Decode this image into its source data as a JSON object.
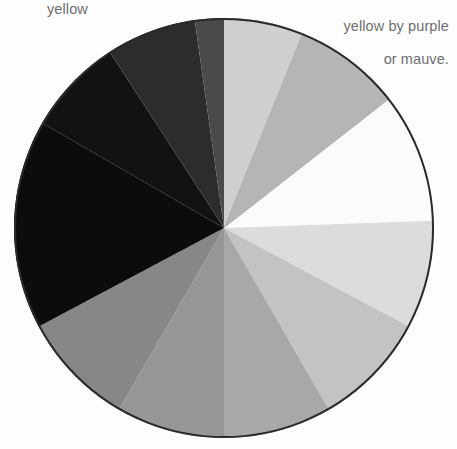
{
  "page": {
    "background_color": "#fdfdfd",
    "width": 457,
    "height": 449
  },
  "captions": {
    "left": {
      "text": "yellow",
      "color": "#6e6e6e",
      "position": "top-left"
    },
    "right": {
      "line1": "yellow by purple",
      "line2": "or mauve.",
      "color": "#6e6e6e",
      "position": "top-right"
    }
  },
  "wheel": {
    "center_x": 224,
    "center_y": 228,
    "radius": 210,
    "outline_color": "#2a2a2a",
    "outline_width": 2,
    "sector_count": 12,
    "description": "Desaturated color wheel rendered in grayscale values"
  },
  "chart_data": {
    "type": "pie",
    "xlabel": "",
    "ylabel": "",
    "legend_position": "none",
    "grid": false,
    "center": [
      224,
      228
    ],
    "radius": 210,
    "note": "Angles measured in degrees clockwise from 12 o'clock (screen up). Each slice is an equal-ish wedge of a desaturated color wheel; value is the gray level of the slice.",
    "categories": [
      "yellow",
      "yellow-orange",
      "orange",
      "red-orange",
      "red",
      "red-violet",
      "violet",
      "blue-violet",
      "blue",
      "blue-green",
      "green",
      "yellow-green"
    ],
    "values": [
      100,
      90,
      78,
      62,
      52,
      46,
      42,
      38,
      30,
      24,
      14,
      5
    ],
    "series": [
      {
        "name": "gray value (0-100)",
        "values": [
          100,
          90,
          78,
          62,
          52,
          46,
          42,
          38,
          30,
          24,
          14,
          5
        ]
      }
    ],
    "slices": [
      {
        "label": "yellow",
        "color": "#fbfbfb",
        "start_angle": 52,
        "end_angle": 88,
        "value": 100
      },
      {
        "label": "yellow-orange",
        "color": "#dcdcdc",
        "start_angle": 88,
        "end_angle": 118,
        "value": 90
      },
      {
        "label": "orange",
        "color": "#c3c3c3",
        "start_angle": 118,
        "end_angle": 150,
        "value": 78
      },
      {
        "label": "red-orange",
        "color": "#a8a8a8",
        "start_angle": 150,
        "end_angle": 180,
        "value": 62
      },
      {
        "label": "red",
        "color": "#969696",
        "start_angle": 180,
        "end_angle": 210,
        "value": 52
      },
      {
        "label": "red-violet",
        "color": "#878787",
        "start_angle": 210,
        "end_angle": 242,
        "value": 46
      },
      {
        "label": "violet",
        "color": "#0c0c0c",
        "start_angle": 242,
        "end_angle": 300,
        "value": 5
      },
      {
        "label": "blue-violet",
        "color": "#121212",
        "start_angle": 300,
        "end_angle": 327,
        "value": 8
      },
      {
        "label": "blue",
        "color": "#2c2c2c",
        "start_angle": 327,
        "end_angle": 352,
        "value": 16
      },
      {
        "label": "blue-green",
        "color": "#4a4a4a",
        "start_angle": 352,
        "end_angle": 378,
        "value": 27
      },
      {
        "label": "green",
        "color": "#6b6b6b",
        "start_angle": 378,
        "end_angle": 400,
        "value": 40
      },
      {
        "label": "yellow-green",
        "color": "#9a9a9a",
        "start_angle": 400,
        "end_angle": 412,
        "value": 56
      }
    ],
    "extra_slices": [
      {
        "label": "pale-yellow-green",
        "color": "#b5b5b5",
        "start_angle": 22,
        "end_angle": 52,
        "value": 70
      },
      {
        "label": "light-green",
        "color": "#cfcfcf",
        "start_angle": 0,
        "end_angle": 22,
        "value": 81
      }
    ]
  }
}
